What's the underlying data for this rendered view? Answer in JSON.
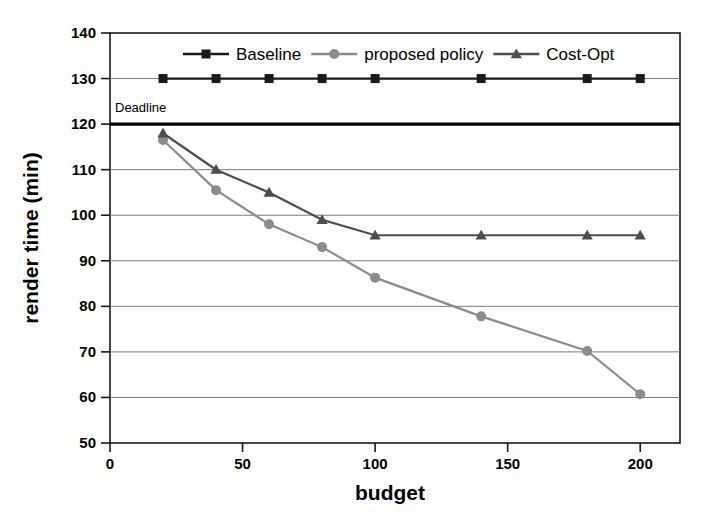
{
  "chart_data": {
    "type": "line",
    "title": "",
    "xlabel": "budget",
    "ylabel": "render time (min)",
    "xlim": [
      0,
      215
    ],
    "ylim": [
      50,
      140
    ],
    "xticks": [
      0,
      50,
      100,
      150,
      200
    ],
    "yticks": [
      50,
      60,
      70,
      80,
      90,
      100,
      110,
      120,
      130,
      140
    ],
    "grid": "horizontal",
    "legend_position": "top-inside",
    "x": [
      20,
      40,
      60,
      80,
      100,
      140,
      180,
      200
    ],
    "series": [
      {
        "name": "Baseline",
        "marker": "square",
        "color": "#1a1a1a",
        "values": [
          130,
          130,
          130,
          130,
          130,
          130,
          130,
          130
        ]
      },
      {
        "name": "proposed policy",
        "marker": "circle",
        "color": "#8c8c8c",
        "values": [
          116.5,
          105.5,
          98.0,
          93.0,
          86.3,
          77.8,
          70.2,
          60.7
        ]
      },
      {
        "name": "Cost-Opt",
        "marker": "triangle",
        "color": "#4d4d4d",
        "values": [
          118.0,
          110.0,
          105.0,
          99.0,
          95.6,
          95.6,
          95.6,
          95.6
        ]
      }
    ],
    "annotations": [
      {
        "name": "deadline-line",
        "label": "Deadline",
        "y": 120,
        "color": "#000000"
      }
    ]
  },
  "axes": {
    "x_tick_labels": [
      "0",
      "50",
      "100",
      "150",
      "200"
    ],
    "y_tick_labels": [
      "50",
      "60",
      "70",
      "80",
      "90",
      "100",
      "110",
      "120",
      "130",
      "140"
    ],
    "x_title": "budget",
    "y_title": "render time (min)"
  },
  "legend": {
    "items": [
      {
        "label": "Baseline"
      },
      {
        "label": "proposed policy"
      },
      {
        "label": "Cost-Opt"
      }
    ]
  },
  "annotation": {
    "deadline_label": "Deadline"
  }
}
